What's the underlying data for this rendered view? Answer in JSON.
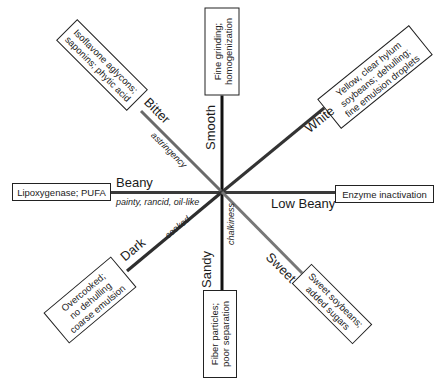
{
  "diagram": {
    "type": "attribute-spoke-diagram",
    "center": [
      222,
      192
    ],
    "colors": {
      "smooth_sandy_axis": "#111111",
      "beany_axis": "#3a3a3a",
      "bitter_axis": "#6a6a6a",
      "white_axis": "#333333",
      "dark_axis": "#2e2e2e",
      "sweet_axis": "#777777",
      "box_border": "#222222"
    },
    "spokes": [
      {
        "pole": "Smooth",
        "cause_lines": [
          "Fine grinding;",
          "homogenization"
        ],
        "descriptor": ""
      },
      {
        "pole": "Sandy",
        "cause_lines": [
          "Fiber particles;",
          "poor separation"
        ],
        "descriptor": "chalkiness"
      },
      {
        "pole": "Beany",
        "cause_lines": [
          "Lipoxygenase; PUFA"
        ],
        "descriptor": "painty, rancid, oil-like"
      },
      {
        "pole": "Low Beany",
        "cause_lines": [
          "Enzyme inactivation"
        ],
        "descriptor": ""
      },
      {
        "pole": "Bitter",
        "cause_lines": [
          "Isoflavone aglycons;",
          "saponins; phytic acid"
        ],
        "descriptor": "astringency"
      },
      {
        "pole": "White",
        "cause_lines": [
          "Yellow, clear hylum",
          "soybeans; dehulling;",
          "fine emulsion droplets"
        ],
        "descriptor": ""
      },
      {
        "pole": "Dark",
        "cause_lines": [
          "Overcooked;",
          "no dehulling",
          "coarse emulsion"
        ],
        "descriptor": "cooked"
      },
      {
        "pole": "Sweet",
        "cause_lines": [
          "Sweet soybeans;",
          "added sugars"
        ],
        "descriptor": ""
      }
    ]
  }
}
